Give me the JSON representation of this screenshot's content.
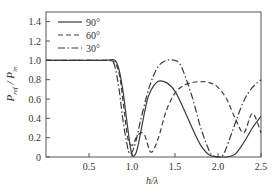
{
  "chart_data": {
    "type": "line",
    "title": "",
    "xlabel": "h/λ",
    "ylabel": "P_ref / P_in",
    "xlim": [
      0,
      2.5
    ],
    "ylim": [
      0,
      1.5
    ],
    "x_ticks": [
      0.5,
      1.0,
      1.5,
      2.0,
      2.5
    ],
    "x_tick_labels": [
      "0.5",
      "1.0",
      "1.5",
      "2.0",
      "2.5"
    ],
    "y_ticks": [
      0,
      0.2,
      0.4,
      0.6,
      0.8,
      1.0,
      1.2,
      1.4
    ],
    "y_tick_labels": [
      "0",
      "0.2",
      "0.4",
      "0.6",
      "0.8",
      "1.0",
      "1.2",
      "1.4"
    ],
    "grid": false,
    "legend_position": "upper left",
    "series": [
      {
        "name": "90°",
        "style": "solid",
        "x": [
          0.0,
          0.5,
          0.7,
          0.8,
          0.85,
          0.9,
          0.95,
          1.0,
          1.05,
          1.1,
          1.15,
          1.2,
          1.3,
          1.4,
          1.5,
          1.6,
          1.7,
          1.8,
          1.9,
          2.0,
          2.1,
          2.2,
          2.3,
          2.4,
          2.5
        ],
        "values": [
          1.0,
          1.0,
          1.0,
          1.0,
          0.9,
          0.65,
          0.3,
          0.02,
          0.05,
          0.25,
          0.48,
          0.65,
          0.78,
          0.77,
          0.68,
          0.5,
          0.3,
          0.12,
          0.02,
          0.0,
          0.0,
          0.03,
          0.15,
          0.3,
          0.42
        ]
      },
      {
        "name": "60°",
        "style": "dashed",
        "x": [
          0.0,
          0.5,
          0.7,
          0.78,
          0.82,
          0.86,
          0.9,
          0.95,
          1.0,
          1.05,
          1.1,
          1.15,
          1.22,
          1.3,
          1.4,
          1.5,
          1.6,
          1.7,
          1.8,
          1.9,
          2.0,
          2.1,
          2.2,
          2.3,
          2.4,
          2.5
        ],
        "values": [
          1.0,
          1.0,
          1.0,
          0.99,
          0.95,
          0.82,
          0.55,
          0.2,
          0.12,
          0.2,
          0.25,
          0.22,
          0.05,
          0.18,
          0.48,
          0.66,
          0.74,
          0.77,
          0.78,
          0.77,
          0.72,
          0.6,
          0.4,
          0.25,
          0.45,
          0.25
        ]
      },
      {
        "name": "30°",
        "style": "dash-dot",
        "x": [
          0.0,
          0.5,
          0.7,
          0.76,
          0.8,
          0.85,
          0.9,
          0.96,
          1.0,
          1.05,
          1.1,
          1.2,
          1.3,
          1.4,
          1.5,
          1.55,
          1.6,
          1.7,
          1.8,
          1.9,
          1.95,
          2.0,
          2.05,
          2.1,
          2.2,
          2.3,
          2.4,
          2.5
        ],
        "values": [
          1.0,
          1.0,
          1.0,
          0.99,
          0.94,
          0.7,
          0.35,
          0.06,
          0.05,
          0.18,
          0.38,
          0.72,
          0.93,
          1.0,
          1.0,
          0.97,
          0.88,
          0.62,
          0.3,
          0.06,
          0.01,
          0.0,
          0.01,
          0.1,
          0.35,
          0.58,
          0.72,
          0.8
        ]
      }
    ]
  }
}
